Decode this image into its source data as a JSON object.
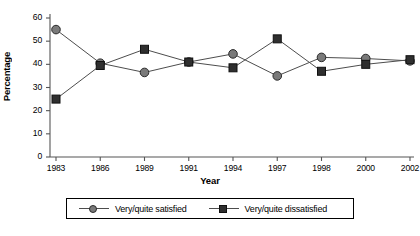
{
  "chart_data": {
    "type": "line",
    "title": "",
    "xlabel": "Year",
    "ylabel": "Percentage",
    "categories": [
      "1983",
      "1986",
      "1989",
      "1991",
      "1994",
      "1997",
      "1998",
      "2000",
      "2002"
    ],
    "series": [
      {
        "name": "Very/quite satisfied",
        "marker": "circle",
        "color": "#7a7a7a",
        "values": [
          55,
          40.5,
          36.5,
          41,
          44.5,
          35,
          43,
          42.5,
          41.5
        ]
      },
      {
        "name": "Very/quite dissatisfied",
        "marker": "square",
        "color": "#2f2f2f",
        "values": [
          25,
          39.5,
          46.5,
          41,
          38.5,
          51,
          37,
          40,
          42
        ]
      }
    ],
    "ylim": [
      0,
      60
    ],
    "yticks": [
      0,
      10,
      20,
      30,
      40,
      50,
      60
    ],
    "ytick_labels": [
      "0",
      "10",
      "20",
      "30",
      "40",
      "50",
      "60"
    ],
    "grid": false,
    "legend_position": "bottom"
  },
  "legend": {
    "items": [
      {
        "label": "Very/quite satisfied"
      },
      {
        "label": "Very/quite dissatisfied"
      }
    ]
  },
  "axes": {
    "x_title": "Year",
    "y_title": "Percentage"
  }
}
